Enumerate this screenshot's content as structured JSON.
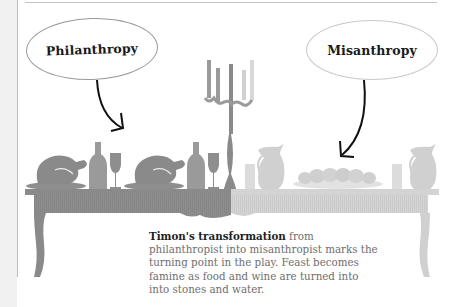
{
  "labels": {
    "left_bubble": "Philanthropy",
    "right_bubble": "Misanthropy"
  },
  "caption": {
    "bold": "Timon's transformation",
    "text": " from philanthropist into misanthropist marks the turning point in the play. Feast becomes famine as food and wine are turned into into stones and water."
  },
  "scene": {
    "left_side": [
      "roast-chicken",
      "wine-bottle",
      "wine-glass",
      "roast-chicken",
      "wine-bottle",
      "wine-glass"
    ],
    "center": "candelabra",
    "right_side": [
      "water-jug",
      "water-glass",
      "plate-of-stones",
      "water-glass",
      "water-jug"
    ]
  },
  "colors": {
    "feast_gray": "#8c8c8c",
    "famine_gray": "#d2d2d2",
    "arrow": "#111111",
    "bubble_border_left": "#9a9a9a",
    "bubble_border_right": "#c9c9c9"
  }
}
